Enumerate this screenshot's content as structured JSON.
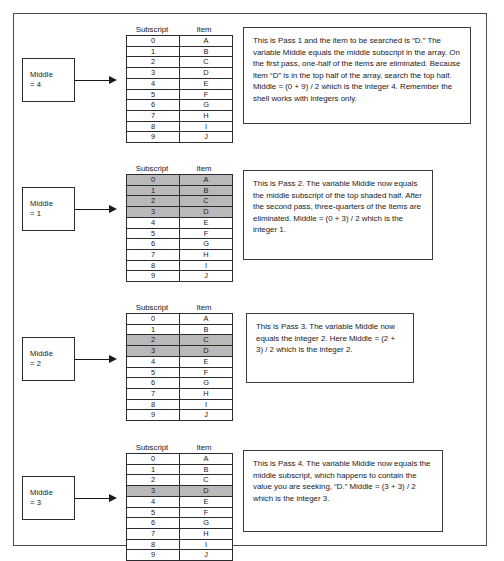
{
  "figure": {
    "accent_shade": "#b9b9b9",
    "border_color": "#4a4a52",
    "array_headers": {
      "subscript": "Subscript",
      "item": "Item"
    },
    "array_subscripts": [
      "0",
      "1",
      "2",
      "3",
      "4",
      "5",
      "6",
      "7",
      "8",
      "9"
    ],
    "array_items": [
      "A",
      "B",
      "C",
      "D",
      "E",
      "F",
      "G",
      "H",
      "I",
      "J"
    ]
  },
  "passes": [
    {
      "middle_label": "Middle",
      "middle_value": "= 4",
      "shaded_rows": [],
      "arrow_target_row": 4,
      "description": "This is Pass 1 and the item to be searched is “D.” The variable Middle equals the middle subscript in the array.  On the first pass, one-half of the items are eliminated. Because item “D” is in the top half of the array, search the top half. Middle = (0 + 9) / 2 which is the integer 4.  Remember the shell works with integers only."
    },
    {
      "middle_label": "Middle",
      "middle_value": "= 1",
      "shaded_rows": [
        0,
        1,
        2,
        3
      ],
      "arrow_target_row": 1,
      "description": "This is Pass 2. The variable Middle now equals the middle subscript of the top shaded half. After the second pass, three-quarters of the items are eliminated. Middle = (0 + 3) / 2 which is the integer 1."
    },
    {
      "middle_label": "Middle",
      "middle_value": "= 2",
      "shaded_rows": [
        2,
        3
      ],
      "arrow_target_row": 2,
      "description": "This is Pass 3. The variable Middle now equals the integer 2. Here Middle = (2 + 3) / 2 which is the integer 2."
    },
    {
      "middle_label": "Middle",
      "middle_value": "= 3",
      "shaded_rows": [
        3
      ],
      "arrow_target_row": 3,
      "description": "This is Pass 4. The variable Middle now equals the middle subscript, which happens to contain the value you are seeking, “D.”  Middle = (3 + 3) / 2 which is the integer 3."
    }
  ]
}
